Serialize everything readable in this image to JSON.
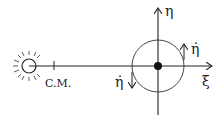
{
  "diagram": {
    "labels": {
      "cm": "C.M.",
      "eta_axis": "η",
      "xi_axis": "ξ",
      "eta_dot_right": "η̇",
      "eta_dot_left": "η̇"
    },
    "colors": {
      "stroke": "#222222",
      "background": "#ffffff"
    }
  }
}
